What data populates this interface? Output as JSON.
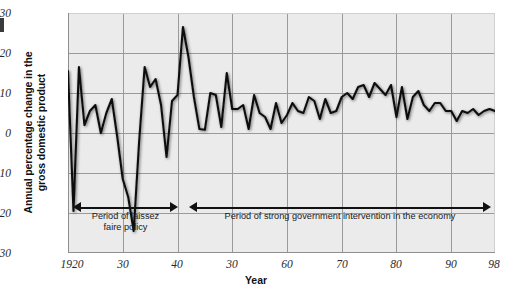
{
  "figure": {
    "background_color": "#ffffff",
    "plot_background_color": "#ebebeb",
    "grid_color": "#9a9a9a",
    "line_color": "#111111"
  },
  "chart_data": {
    "type": "line",
    "title": "",
    "xlabel": "Year",
    "ylabel": "Annual percentage change in the gross domestic product",
    "ylabel_line1": "Annual percentage change in the",
    "ylabel_line2": "gross domestic product",
    "xlim": [
      1920,
      1998
    ],
    "ylim": [
      -30,
      30
    ],
    "grid": true,
    "legend_position": "none",
    "ytick_labels": [
      "30",
      "20",
      "10",
      "0",
      "-10",
      "-20",
      "-30"
    ],
    "ytick_values": [
      30,
      20,
      10,
      0,
      -10,
      -20,
      -30
    ],
    "xtick_labels": [
      "1920",
      "30",
      "40",
      "30",
      "60",
      "70",
      "80",
      "90",
      "98"
    ],
    "xtick_values": [
      1920,
      1930,
      1940,
      1950,
      1960,
      1970,
      1980,
      1990,
      1998
    ],
    "series": [
      {
        "name": "Annual percentage change in GDP",
        "x": [
          1920,
          1921,
          1922,
          1923,
          1924,
          1925,
          1926,
          1927,
          1928,
          1929,
          1930,
          1931,
          1932,
          1933,
          1934,
          1935,
          1936,
          1937,
          1938,
          1939,
          1940,
          1941,
          1942,
          1943,
          1944,
          1945,
          1946,
          1947,
          1948,
          1949,
          1950,
          1951,
          1952,
          1953,
          1954,
          1955,
          1956,
          1957,
          1958,
          1959,
          1960,
          1961,
          1962,
          1963,
          1964,
          1965,
          1966,
          1967,
          1968,
          1969,
          1970,
          1971,
          1972,
          1973,
          1974,
          1975,
          1976,
          1977,
          1978,
          1979,
          1980,
          1981,
          1982,
          1983,
          1984,
          1985,
          1986,
          1987,
          1988,
          1989,
          1990,
          1991,
          1992,
          1993,
          1994,
          1995,
          1996,
          1997,
          1998
        ],
        "values": [
          15.5,
          -19.5,
          16.5,
          2.0,
          5.5,
          7.0,
          0.0,
          5.0,
          8.5,
          -1.0,
          -11.5,
          -16.0,
          -24.5,
          -2.0,
          16.5,
          11.5,
          13.5,
          7.0,
          -6.0,
          8.0,
          9.5,
          26.5,
          19.0,
          9.0,
          1.0,
          0.8,
          10.0,
          9.5,
          1.5,
          15.0,
          6.0,
          6.0,
          7.0,
          1.0,
          9.5,
          5.0,
          4.0,
          1.0,
          7.5,
          2.5,
          4.5,
          7.5,
          5.5,
          5.0,
          9.0,
          8.0,
          3.5,
          8.5,
          5.0,
          5.5,
          9.0,
          10.0,
          8.5,
          11.5,
          12.0,
          9.0,
          12.5,
          11.0,
          9.5,
          12.0,
          4.0,
          11.5,
          3.5,
          9.0,
          10.5,
          7.0,
          5.5,
          7.5,
          7.5,
          5.5,
          5.5,
          3.0,
          5.5,
          5.0,
          6.0,
          4.5,
          5.5,
          6.0,
          5.5
        ]
      }
    ],
    "annotations": [
      {
        "id": "period-laissez-faire",
        "text_line1": "Period of laissez",
        "text_line2": "faire policy",
        "x_start": 1921,
        "x_end": 1940
      },
      {
        "id": "period-government-intervention",
        "text_line1": "Period of strong government intervention in the economy",
        "text_line2": "",
        "x_start": 1942,
        "x_end": 1998
      }
    ]
  }
}
